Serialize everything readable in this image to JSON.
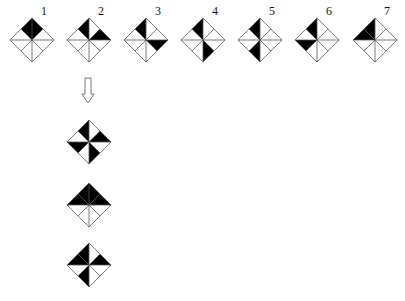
{
  "diagram": {
    "triangle_order": [
      "T1: center-top-midUR",
      "T2: center-midUR-right",
      "T3: center-right-midLR",
      "T4: center-midLR-bottom",
      "T5: center-bottom-midLL",
      "T6: center-midLL-left",
      "T7: center-left-midUL",
      "T8: center-midUL-top"
    ],
    "fill_color": "#000000",
    "line_color": "#555555",
    "sequence": [
      {
        "label": "1",
        "cx": 32,
        "cy": 40,
        "filled": [
          8,
          1
        ]
      },
      {
        "label": "2",
        "cx": 89,
        "cy": 40,
        "filled": [
          8,
          2
        ]
      },
      {
        "label": "3",
        "cx": 146,
        "cy": 40,
        "filled": [
          8,
          3
        ]
      },
      {
        "label": "4",
        "cx": 203,
        "cy": 40,
        "filled": [
          8,
          4
        ]
      },
      {
        "label": "5",
        "cx": 260,
        "cy": 40,
        "filled": [
          8,
          5
        ]
      },
      {
        "label": "6",
        "cx": 317,
        "cy": 40,
        "filled": [
          8,
          6
        ]
      },
      {
        "label": "7",
        "cx": 375,
        "cy": 40,
        "filled": [
          7,
          8
        ]
      }
    ],
    "arrow": {
      "direction": "down",
      "style": "hollow",
      "x": 88,
      "y_top": 78,
      "y_bottom": 103
    },
    "options": [
      {
        "cx": 89,
        "cy": 142,
        "filled": [
          8,
          2,
          4,
          6
        ]
      },
      {
        "cx": 89,
        "cy": 205,
        "filled": [
          7,
          8,
          1,
          2
        ]
      },
      {
        "cx": 89,
        "cy": 265,
        "filled": [
          7,
          8,
          2,
          5
        ]
      }
    ],
    "half_size": 22
  }
}
